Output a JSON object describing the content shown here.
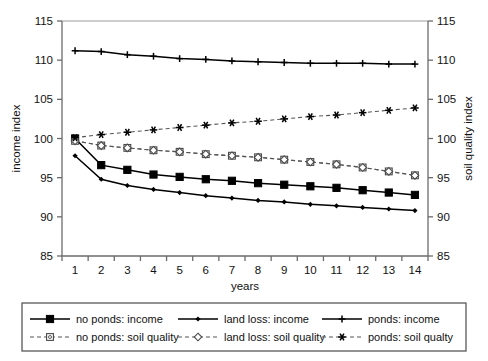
{
  "chart_data": {
    "type": "line",
    "title": "",
    "xlabel": "years",
    "ylabel": "income index",
    "y2label": "soil quality index",
    "x": [
      1,
      2,
      3,
      4,
      5,
      6,
      7,
      8,
      9,
      10,
      11,
      12,
      13,
      14
    ],
    "xtick_labels": [
      "1",
      "2",
      "3",
      "4",
      "5",
      "6",
      "7",
      "8",
      "9",
      "10",
      "11",
      "12",
      "13",
      "14"
    ],
    "ylim": [
      85,
      115
    ],
    "yticks": [
      85,
      90,
      95,
      100,
      105,
      110,
      115
    ],
    "ytick_labels": [
      "85",
      "90",
      "95",
      "100",
      "105",
      "110",
      "115"
    ],
    "y2lim": [
      85,
      115
    ],
    "y2ticks": [
      85,
      90,
      95,
      100,
      105,
      110,
      115
    ],
    "y2tick_labels": [
      "85",
      "90",
      "95",
      "100",
      "105",
      "110",
      "115"
    ],
    "grid": false,
    "legend_position": "bottom",
    "series": [
      {
        "name": "no ponds: income",
        "axis": "left",
        "style": "solid",
        "marker": "filled-square",
        "color": "#000000",
        "values": [
          100.0,
          96.6,
          96.0,
          95.4,
          95.1,
          94.8,
          94.6,
          94.3,
          94.1,
          93.9,
          93.7,
          93.4,
          93.1,
          92.8
        ]
      },
      {
        "name": "land loss: income",
        "axis": "left",
        "style": "solid",
        "marker": "small-diamond",
        "color": "#000000",
        "values": [
          97.8,
          94.8,
          94.0,
          93.5,
          93.1,
          92.7,
          92.4,
          92.1,
          91.9,
          91.6,
          91.4,
          91.2,
          91.0,
          90.8
        ]
      },
      {
        "name": "ponds: income",
        "axis": "left",
        "style": "solid",
        "marker": "plus",
        "color": "#000000",
        "values": [
          111.2,
          111.1,
          110.7,
          110.5,
          110.2,
          110.1,
          109.9,
          109.8,
          109.7,
          109.6,
          109.6,
          109.6,
          109.5,
          109.5
        ]
      },
      {
        "name": "no ponds: soil quality",
        "axis": "right",
        "style": "dashed",
        "marker": "open-square",
        "color": "#555555",
        "values": [
          99.7,
          99.1,
          98.8,
          98.5,
          98.3,
          98.0,
          97.8,
          97.6,
          97.3,
          97.0,
          96.7,
          96.3,
          95.8,
          95.3
        ]
      },
      {
        "name": "land loss: soil quality",
        "axis": "right",
        "style": "dashed",
        "marker": "open-diamond",
        "color": "#555555",
        "values": [
          99.7,
          99.1,
          98.8,
          98.5,
          98.3,
          98.0,
          97.8,
          97.6,
          97.3,
          97.0,
          96.7,
          96.3,
          95.8,
          95.3
        ]
      },
      {
        "name": "ponds: soil qualty",
        "axis": "right",
        "style": "dashed",
        "marker": "asterisk",
        "color": "#000000",
        "values": [
          100.1,
          100.5,
          100.8,
          101.1,
          101.4,
          101.7,
          102.0,
          102.2,
          102.5,
          102.8,
          103.0,
          103.3,
          103.6,
          103.9
        ]
      }
    ],
    "legend": [
      {
        "label": "no ponds: income",
        "marker": "filled-square",
        "style": "solid"
      },
      {
        "label": "land loss: income",
        "marker": "small-diamond",
        "style": "solid"
      },
      {
        "label": "ponds: income",
        "marker": "plus",
        "style": "solid"
      },
      {
        "label": "no ponds: soil quality",
        "marker": "open-square",
        "style": "dashed"
      },
      {
        "label": "land loss: soil quality",
        "marker": "open-diamond",
        "style": "dashed"
      },
      {
        "label": "ponds: soil qualty",
        "marker": "asterisk",
        "style": "dashed"
      }
    ],
    "colors": {
      "ink": "#000000",
      "axis": "#6b6b6b",
      "dashed": "#555555"
    }
  }
}
